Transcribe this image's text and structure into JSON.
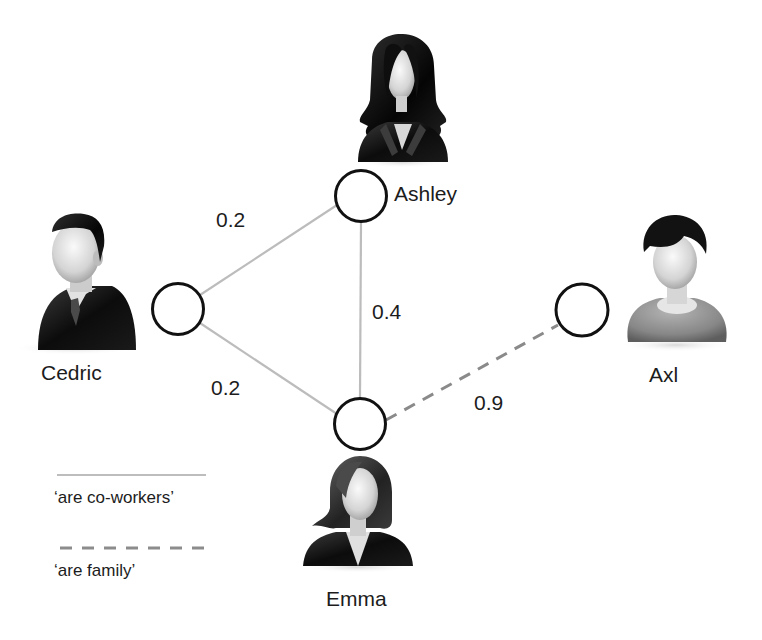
{
  "diagram": {
    "type": "social-network-graph",
    "nodes": [
      {
        "id": "ashley",
        "name": "Ashley",
        "avatar": "woman-long-hair-icon"
      },
      {
        "id": "cedric",
        "name": "Cedric",
        "avatar": "man-suit-tie-icon"
      },
      {
        "id": "emma",
        "name": "Emma",
        "avatar": "woman-bob-hair-icon"
      },
      {
        "id": "axl",
        "name": "Axl",
        "avatar": "boy-casual-icon"
      }
    ],
    "edges": [
      {
        "from": "cedric",
        "to": "ashley",
        "weight": "0.2",
        "relation": "are co-workers",
        "style": "solid"
      },
      {
        "from": "cedric",
        "to": "emma",
        "weight": "0.2",
        "relation": "are co-workers",
        "style": "solid"
      },
      {
        "from": "ashley",
        "to": "emma",
        "weight": "0.4",
        "relation": "are co-workers",
        "style": "solid"
      },
      {
        "from": "emma",
        "to": "axl",
        "weight": "0.9",
        "relation": "are family",
        "style": "dashed"
      }
    ],
    "legend": [
      {
        "style": "solid",
        "label": "‘are co-workers’"
      },
      {
        "style": "dashed",
        "label": "‘are family’"
      }
    ],
    "colors": {
      "node_stroke": "#111111",
      "node_fill": "#ffffff",
      "edge": "#b9b9b9",
      "dashed_edge": "#8a8a8a",
      "text": "#1c1c1c"
    }
  }
}
